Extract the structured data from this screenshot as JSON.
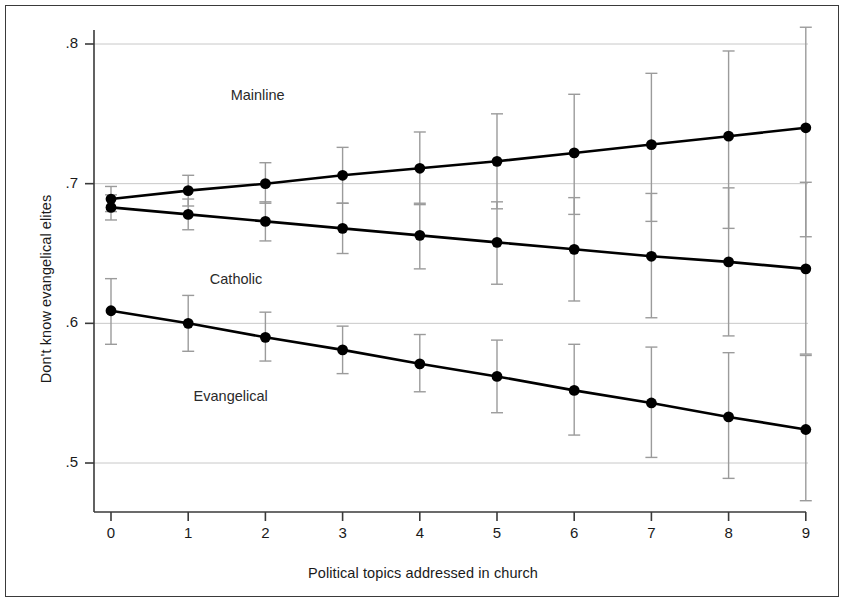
{
  "chart_data": {
    "type": "line",
    "title": "",
    "xlabel": "Political topics addressed in church",
    "ylabel": "Don't know evangelical elites",
    "x": [
      0,
      1,
      2,
      3,
      4,
      5,
      6,
      7,
      8,
      9
    ],
    "xtick_labels": [
      "0",
      "1",
      "2",
      "3",
      "4",
      "5",
      "6",
      "7",
      "8",
      "9"
    ],
    "ytick_labels": [
      ".8",
      ".7",
      ".6",
      ".5"
    ],
    "ytick_values": [
      0.8,
      0.7,
      0.6,
      0.5
    ],
    "xlim": [
      -0.25,
      9.25
    ],
    "ylim": [
      0.47,
      0.815
    ],
    "grid": "horizontal",
    "legend_position": "inline-annotations",
    "error_bars": "95% confidence intervals",
    "marker": "filled-circle",
    "line_color": "#000000",
    "errorbar_color": "#9b9b9b",
    "grid_color": "#c8c8c8",
    "series": [
      {
        "name": "Mainline",
        "values": [
          0.689,
          0.695,
          0.7,
          0.706,
          0.711,
          0.716,
          0.722,
          0.728,
          0.734,
          0.74
        ],
        "ci_low": [
          0.68,
          0.684,
          0.686,
          0.686,
          0.685,
          0.682,
          0.678,
          0.673,
          0.668,
          0.662
        ],
        "ci_high": [
          0.698,
          0.706,
          0.715,
          0.726,
          0.737,
          0.75,
          0.764,
          0.779,
          0.795,
          0.812
        ],
        "label_x": 1.55,
        "label_y": 0.763
      },
      {
        "name": "Catholic",
        "values": [
          0.683,
          0.678,
          0.673,
          0.668,
          0.663,
          0.658,
          0.653,
          0.648,
          0.644,
          0.639
        ],
        "ci_low": [
          0.674,
          0.667,
          0.659,
          0.65,
          0.639,
          0.628,
          0.616,
          0.604,
          0.591,
          0.578
        ],
        "ci_high": [
          0.692,
          0.689,
          0.687,
          0.686,
          0.686,
          0.687,
          0.69,
          0.693,
          0.697,
          0.701
        ],
        "label_x": 1.28,
        "label_y": 0.631
      },
      {
        "name": "Evangelical",
        "values": [
          0.609,
          0.6,
          0.59,
          0.581,
          0.571,
          0.562,
          0.552,
          0.543,
          0.533,
          0.524
        ],
        "ci_low": [
          0.585,
          0.58,
          0.573,
          0.564,
          0.551,
          0.536,
          0.52,
          0.504,
          0.489,
          0.473
        ],
        "ci_high": [
          0.632,
          0.62,
          0.608,
          0.598,
          0.592,
          0.588,
          0.585,
          0.583,
          0.579,
          0.577
        ],
        "label_x": 1.07,
        "label_y": 0.547
      }
    ]
  }
}
